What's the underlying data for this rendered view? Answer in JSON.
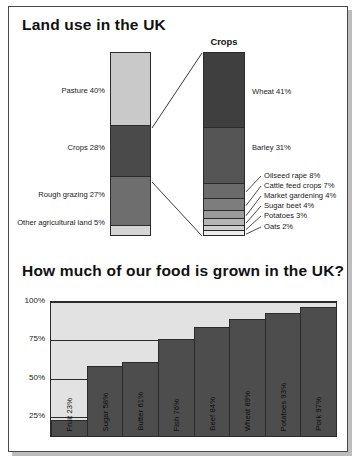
{
  "panels": {
    "landuse_title": "Land use in the UK",
    "food_title": "How much of our food is grown in the UK?",
    "crops_caption": "Crops"
  },
  "chart_data": [
    {
      "type": "bar",
      "title": "Land use in the UK",
      "subtype": "stacked-vertical",
      "categories": [
        "Pasture",
        "Crops",
        "Rough grazing",
        "Other agricultural land"
      ],
      "values": [
        40,
        27,
        28,
        5
      ],
      "labels": [
        "Pasture 40%",
        "Crops 28%",
        "Rough grazing 27%",
        "Other agricultural land 5%"
      ],
      "unit": "%",
      "xlabel": "",
      "ylabel": "",
      "ylim": [
        0,
        100
      ],
      "grid": false,
      "legend": "none",
      "segments": [
        {
          "name": "Pasture",
          "value": 40,
          "label": "Pasture 40%",
          "color": "#c9c9c9"
        },
        {
          "name": "Crops",
          "value": 28,
          "label": "Crops 28%",
          "color": "#4a4a4a"
        },
        {
          "name": "Rough grazing",
          "value": 27,
          "label": "Rough grazing 27%",
          "color": "#6e6e6e"
        },
        {
          "name": "Other agricultural land",
          "value": 5,
          "label": "Other agricultural land 5%",
          "color": "#d4d4d4"
        }
      ]
    },
    {
      "type": "bar",
      "title": "Crops",
      "subtype": "stacked-vertical",
      "categories": [
        "Wheat",
        "Barley",
        "Oilseed rape",
        "Cattle feed crops",
        "Market gardening",
        "Sugar beet",
        "Potatoes",
        "Oats"
      ],
      "values": [
        41,
        31,
        8,
        7,
        4,
        4,
        3,
        2
      ],
      "unit": "%",
      "xlabel": "",
      "ylabel": "",
      "ylim": [
        0,
        100
      ],
      "grid": false,
      "legend": "none",
      "segments": [
        {
          "name": "Wheat",
          "value": 41,
          "label": "Wheat 41%",
          "color": "#3f3f3f"
        },
        {
          "name": "Barley",
          "value": 31,
          "label": "Barley 31%",
          "color": "#555555"
        },
        {
          "name": "Oilseed rape",
          "value": 8,
          "label": "Oilseed rape 8%",
          "color": "#6b6b6b"
        },
        {
          "name": "Cattle feed crops",
          "value": 7,
          "label": "Cattle feed crops 7%",
          "color": "#7d7d7d"
        },
        {
          "name": "Market gardening",
          "value": 4,
          "label": "Market gardening 4%",
          "color": "#9a9a9a"
        },
        {
          "name": "Sugar beet",
          "value": 4,
          "label": "Sugar beet 4%",
          "color": "#b5b5b5"
        },
        {
          "name": "Potatoes",
          "value": 3,
          "label": "Potatoes 3%",
          "color": "#cfcfcf"
        },
        {
          "name": "Oats",
          "value": 2,
          "label": "Oats 2%",
          "color": "#ececec"
        }
      ]
    },
    {
      "type": "bar",
      "title": "How much of our food is grown in the UK?",
      "categories": [
        "Fruit",
        "Sugar",
        "Butter",
        "Fish",
        "Beef",
        "Wheat",
        "Potatoes",
        "Pork"
      ],
      "values": [
        23,
        58,
        61,
        76,
        84,
        89,
        93,
        97
      ],
      "bar_labels": [
        "Fruit 23%",
        "Sugar 58%",
        "Butter 61%",
        "Fish 76%",
        "Beef 84%",
        "Wheat 89%",
        "Potatoes 93%",
        "Pork 97%"
      ],
      "unit": "%",
      "xlabel": "",
      "ylabel": "",
      "ylim": [
        0,
        100
      ],
      "yticks": [
        "25%",
        "50%",
        "75%",
        "100%"
      ],
      "ytick_values": [
        25,
        50,
        75,
        100
      ],
      "grid": true,
      "legend": "none",
      "bar_color": "#4d4d4d",
      "plot_background": "#e2e2e2"
    }
  ]
}
